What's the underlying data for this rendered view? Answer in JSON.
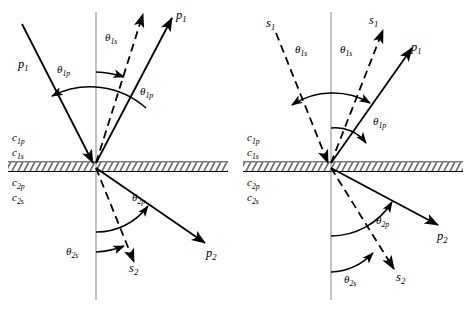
{
  "figure": {
    "type": "physics-diagram",
    "panels": [
      {
        "id": "panel-left",
        "incident_wave": "p",
        "rays": [
          {
            "name": "incident-p1",
            "label": "p",
            "sub": "1",
            "style": "solid",
            "region": "upper",
            "direction": "incoming-from-upper-left"
          },
          {
            "name": "reflected-p1",
            "label": "p",
            "sub": "1",
            "style": "solid",
            "region": "upper",
            "direction": "outgoing-upper-right"
          },
          {
            "name": "reflected-s1",
            "label": "",
            "sub": "",
            "style": "dashed",
            "region": "upper",
            "direction": "outgoing-upper-right"
          },
          {
            "name": "transmitted-p2",
            "label": "p",
            "sub": "2",
            "style": "solid",
            "region": "lower",
            "direction": "outgoing-lower-right"
          },
          {
            "name": "transmitted-s2",
            "label": "s",
            "sub": "2",
            "style": "dashed",
            "region": "lower",
            "direction": "outgoing-lower-right"
          }
        ],
        "angles": [
          {
            "name": "theta-1s-upper",
            "symbol": "θ",
            "sub": "1s"
          },
          {
            "name": "theta-1p-incident",
            "symbol": "θ",
            "sub": "1p"
          },
          {
            "name": "theta-1p-reflected",
            "symbol": "θ",
            "sub": "1p"
          },
          {
            "name": "theta-2p",
            "symbol": "θ",
            "sub": "2p"
          },
          {
            "name": "theta-2s",
            "symbol": "θ",
            "sub": "2s"
          }
        ],
        "velocities": [
          {
            "name": "c-1p",
            "symbol": "c",
            "sub": "1p",
            "region": "upper"
          },
          {
            "name": "c-1s",
            "symbol": "c",
            "sub": "1s",
            "region": "upper"
          },
          {
            "name": "c-2p",
            "symbol": "c",
            "sub": "2p",
            "region": "lower"
          },
          {
            "name": "c-2s",
            "symbol": "c",
            "sub": "2s",
            "region": "lower"
          }
        ]
      },
      {
        "id": "panel-right",
        "incident_wave": "s",
        "rays": [
          {
            "name": "incident-s1",
            "label": "s",
            "sub": "1",
            "style": "dashed",
            "region": "upper",
            "direction": "incoming-from-upper-left"
          },
          {
            "name": "reflected-s1",
            "label": "s",
            "sub": "1",
            "style": "dashed",
            "region": "upper",
            "direction": "outgoing-upper-right"
          },
          {
            "name": "reflected-p1",
            "label": "p",
            "sub": "1",
            "style": "solid",
            "region": "upper",
            "direction": "outgoing-upper-right"
          },
          {
            "name": "transmitted-p2",
            "label": "p",
            "sub": "2",
            "style": "solid",
            "region": "lower",
            "direction": "outgoing-lower-right"
          },
          {
            "name": "transmitted-s2",
            "label": "s",
            "sub": "2",
            "style": "dashed",
            "region": "lower",
            "direction": "outgoing-lower-right"
          }
        ],
        "angles": [
          {
            "name": "theta-1s-incident",
            "symbol": "θ",
            "sub": "1s"
          },
          {
            "name": "theta-1s-reflected",
            "symbol": "θ",
            "sub": "1s"
          },
          {
            "name": "theta-1p",
            "symbol": "θ",
            "sub": "1p"
          },
          {
            "name": "theta-2p",
            "symbol": "θ",
            "sub": "2p"
          },
          {
            "name": "theta-2s",
            "symbol": "θ",
            "sub": "2s"
          }
        ],
        "velocities": [
          {
            "name": "c-1p",
            "symbol": "c",
            "sub": "1p",
            "region": "upper"
          },
          {
            "name": "c-1s",
            "symbol": "c",
            "sub": "1s",
            "region": "upper"
          },
          {
            "name": "c-2p",
            "symbol": "c",
            "sub": "2p",
            "region": "lower"
          },
          {
            "name": "c-2s",
            "symbol": "c",
            "sub": "2s",
            "region": "lower"
          }
        ]
      }
    ],
    "colors": {
      "line": "#000000",
      "normal_axis": "#808080",
      "interface": "#000000",
      "background": "#ffffff"
    },
    "text": {
      "theta_1s": "θ",
      "theta_1p": "θ",
      "theta_2p": "θ",
      "theta_2s": "θ",
      "sub_1s": "1s",
      "sub_1p": "1p",
      "sub_2p": "2p",
      "sub_2s": "2s",
      "p": "p",
      "s": "s",
      "c": "c",
      "sub_1": "1",
      "sub_2": "2",
      "c_sub_1p": "1p",
      "c_sub_1s": "1s",
      "c_sub_2p": "2p",
      "c_sub_2s": "2s"
    }
  }
}
